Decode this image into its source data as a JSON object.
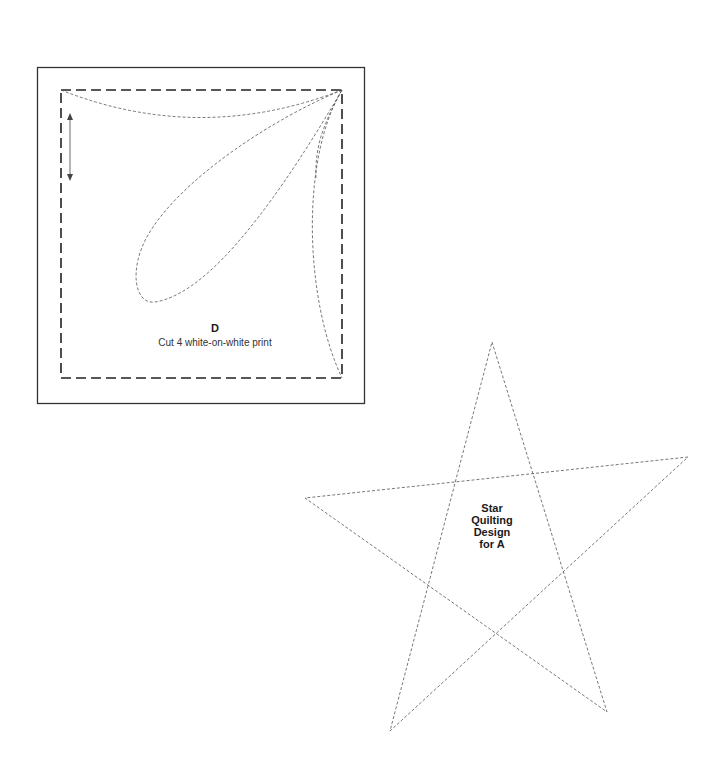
{
  "template_d": {
    "letter": "D",
    "instruction": "Cut 4 white-on-white print",
    "colors": {
      "outline": "#333333",
      "dashed": "#222222",
      "quilting": "#555555"
    }
  },
  "star_template": {
    "line1": "Star",
    "line2": "Quilting",
    "line3": "Design",
    "line4": "for A",
    "vertices": [
      [
        492,
        342
      ],
      [
        688,
        457
      ],
      [
        305,
        498
      ],
      [
        390,
        731
      ],
      [
        607,
        712
      ]
    ]
  }
}
